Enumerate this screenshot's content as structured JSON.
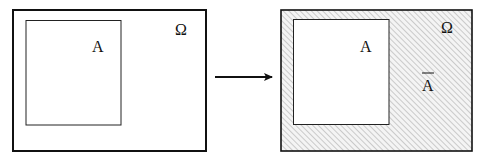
{
  "diagram": {
    "left_panel": {
      "universe_label": "Ω",
      "set_label": "A"
    },
    "arrow": {
      "direction": "right"
    },
    "right_panel": {
      "universe_label": "Ω",
      "set_label": "A",
      "complement_label": "A",
      "complement_overbar": true,
      "hatch_fill": "diagonal"
    },
    "colors": {
      "stroke": "#111111",
      "hatch": "#b8b8b8",
      "background": "#ffffff"
    }
  }
}
